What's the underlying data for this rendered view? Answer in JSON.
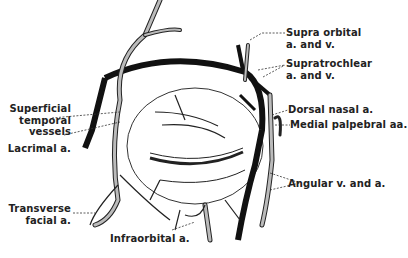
{
  "diagram": {
    "labels_right": [
      {
        "id": "supraorbital",
        "line1": "Supra orbital",
        "line2": "a. and v."
      },
      {
        "id": "supratrochlear",
        "line1": "Supratrochlear",
        "line2": "a. and v."
      },
      {
        "id": "dorsal_nasal",
        "line1": "Dorsal nasal a."
      },
      {
        "id": "medial_palpebral",
        "line1": "Medial palpebral aa."
      },
      {
        "id": "angular",
        "line1": "Angular v. and a."
      }
    ],
    "labels_left": [
      {
        "id": "superficial_temporal",
        "line1": "Superficial",
        "line2": "temporal",
        "line3": "vessels"
      },
      {
        "id": "lacrimal",
        "line1": "Lacrimal a."
      },
      {
        "id": "transverse_facial",
        "line1": "Transverse",
        "line2": "facial a."
      }
    ],
    "labels_bottom": [
      {
        "id": "infraorbital",
        "line1": "Infraorbital a."
      }
    ],
    "colors": {
      "vein": "#111111",
      "artery_fill": "#bbbbbb",
      "outline": "#222222",
      "leader": "#333333"
    }
  }
}
